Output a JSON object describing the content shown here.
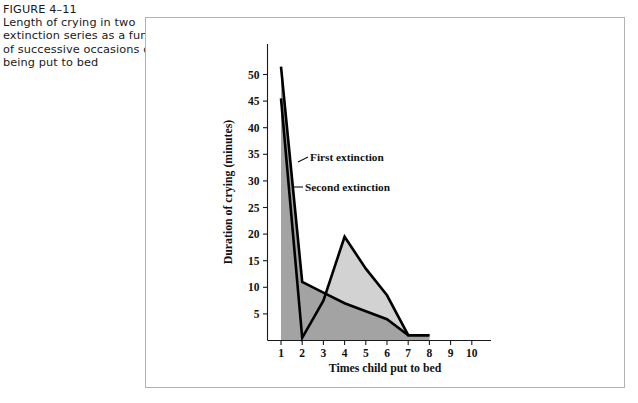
{
  "caption": {
    "figure_number": "FIGURE 4–11",
    "lines": [
      "FIGURE 4–11",
      "Length of crying in two",
      "extinction series as a function",
      "of successive occasions of",
      "being put to bed"
    ]
  },
  "chart_data": {
    "type": "area",
    "title": "",
    "xlabel": "Times child put to bed",
    "ylabel": "Duration of crying (minutes)",
    "xlim": [
      0,
      10
    ],
    "ylim": [
      0,
      53
    ],
    "xticks": [
      1,
      2,
      3,
      4,
      5,
      6,
      7,
      8,
      9,
      10
    ],
    "xtick_labels": [
      "1",
      "2",
      "3",
      "4",
      "5",
      "6",
      "7",
      "8",
      "9",
      "10"
    ],
    "yticks": [
      5,
      10,
      15,
      20,
      25,
      30,
      35,
      40,
      45,
      50
    ],
    "ytick_labels": [
      "5",
      "10",
      "15",
      "20",
      "25",
      "30",
      "35",
      "40",
      "45",
      "50"
    ],
    "grid": false,
    "legend_position": "inline-annotation",
    "x": [
      1,
      2,
      3,
      4,
      5,
      6,
      7,
      8
    ],
    "series": [
      {
        "name": "First extinction",
        "color": "#a3a3a3",
        "values": [
          51.5,
          11.0,
          9.0,
          7.0,
          5.5,
          4.0,
          1.0,
          1.0
        ]
      },
      {
        "name": "Second extinction",
        "color": "#d2d2d2",
        "values": [
          45.5,
          0.5,
          7.5,
          19.5,
          13.5,
          8.5,
          1.0,
          1.0
        ]
      }
    ],
    "annotations": [
      {
        "text": "First extinction",
        "series": "First extinction"
      },
      {
        "text": "Second extinction",
        "series": "Second extinction"
      }
    ]
  },
  "colors": {
    "first_extinction_fill": "#a3a3a3",
    "second_extinction_fill": "#d2d2d2",
    "line": "#000000",
    "frame": "#b2b2b2",
    "page_background": "#ffffff"
  }
}
